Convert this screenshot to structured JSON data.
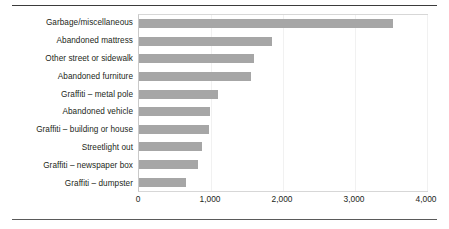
{
  "chart_data": {
    "type": "bar",
    "orientation": "horizontal",
    "title": "",
    "subtitle": "",
    "xlabel": "",
    "ylabel": "",
    "xlim": [
      0,
      4000
    ],
    "xticks": [
      0,
      1000,
      2000,
      3000,
      4000
    ],
    "xtick_labels": [
      "0",
      "1,000",
      "2,000",
      "3,000",
      "4,000"
    ],
    "grid": true,
    "grid_axis": "x",
    "legend": false,
    "legend_position": "none",
    "bar_color": "#a6a6a6",
    "categories": [
      "Garbage/miscellaneous",
      "Abandoned mattress",
      "Other street or sidewalk",
      "Abandoned furniture",
      "Graffiti – metal pole",
      "Abandoned vehicle",
      "Graffiti – building or house",
      "Streetlight out",
      "Graffiti – newspaper box",
      "Graffiti – dumpster"
    ],
    "values": [
      3530,
      1850,
      1600,
      1560,
      1100,
      980,
      975,
      870,
      815,
      650
    ]
  }
}
